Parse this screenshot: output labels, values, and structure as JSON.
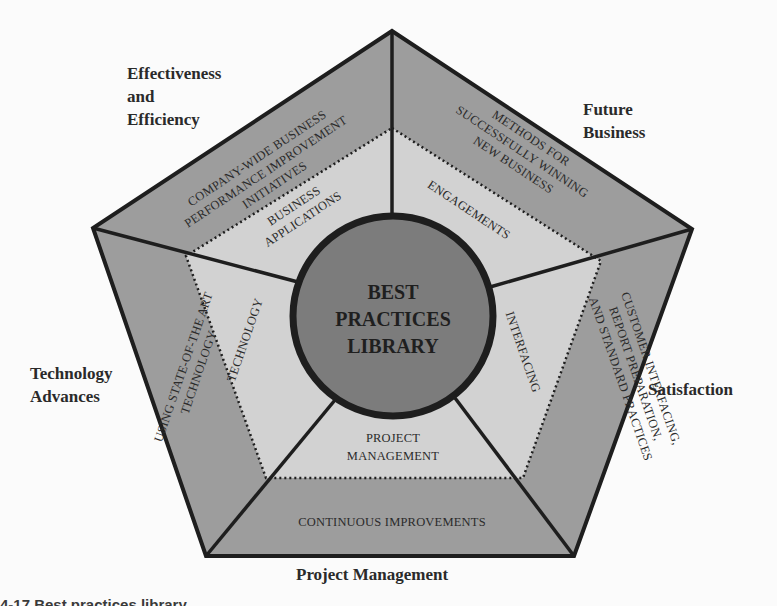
{
  "diagram": {
    "title": "Best Practices Library",
    "center": {
      "lines": [
        "BEST",
        "PRACTICES",
        "LIBRARY"
      ]
    },
    "outer_labels": {
      "top_left": "Effectiveness\nand\nEfficiency",
      "top_right": "Future\nBusiness",
      "left": "Technology\nAdvances",
      "right": "Satisfaction",
      "bottom": "Project Management"
    },
    "outer_ring": {
      "top_left": [
        "COMPANY-WIDE BUSINESS",
        "PERFORMANCE IMPROVEMENT",
        "INITIATIVES"
      ],
      "top_right": [
        "METHODS FOR",
        "SUCCESSFULLY WINNING",
        "NEW BUSINESS"
      ],
      "left": [
        "USING STATE-OF-THE ART",
        "TECHNOLOGY"
      ],
      "right": [
        "CUSTOMER INTERFACING,",
        "REPORT PREPARATION,",
        "AND STANDARD PRACTICES"
      ],
      "bottom": [
        "CONTINUOUS IMPROVEMENTS"
      ]
    },
    "inner_ring": {
      "top_left": [
        "BUSINESS",
        "APPLICATIONS"
      ],
      "top_right": [
        "ENGAGEMENTS"
      ],
      "left": [
        "TECHNOLOGY"
      ],
      "right": [
        "INTERFACING"
      ],
      "bottom": [
        "PROJECT",
        "MANAGEMENT"
      ]
    },
    "colors": {
      "outer_fill": "#9d9d9d",
      "inner_fill": "#d2d2d2",
      "center_fill": "#7c7c7c",
      "stroke": "#1e1e1e",
      "background": "#fbfbfb"
    }
  },
  "caption": {
    "text": "4-17  Best practices library."
  }
}
